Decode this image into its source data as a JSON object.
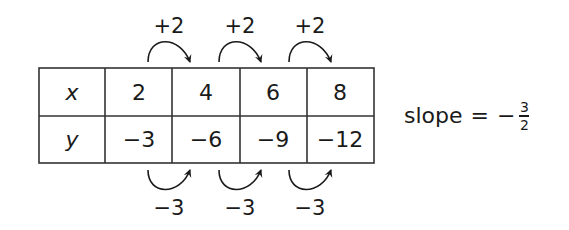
{
  "table": {
    "row_labels": [
      "x",
      "y"
    ],
    "x_values": [
      "2",
      "4",
      "6",
      "8"
    ],
    "y_values": [
      "−3",
      "−6",
      "−9",
      "−12"
    ]
  },
  "top_arrows": {
    "labels": [
      "+2",
      "+2",
      "+2"
    ]
  },
  "bottom_arrows": {
    "labels": [
      "−3",
      "−3",
      "−3"
    ]
  },
  "slope": {
    "prefix": "slope",
    "equals": "=",
    "sign": "−",
    "numerator": "3",
    "denominator": "2"
  }
}
